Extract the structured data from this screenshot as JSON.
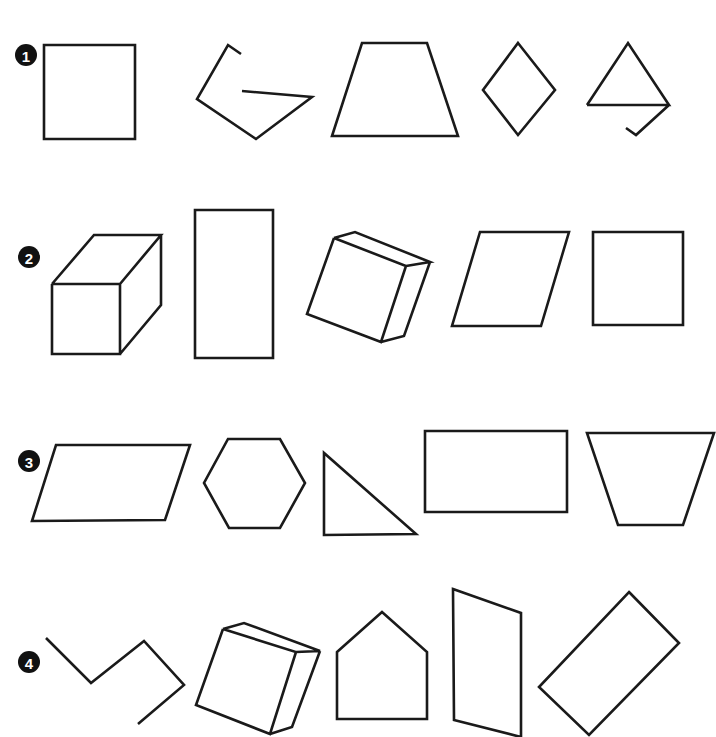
{
  "worksheet": {
    "title": "Shape recognition rows",
    "rows": [
      {
        "label": "1",
        "badge": {
          "cx": 26,
          "cy": 55
        },
        "shapes": [
          {
            "name": "square",
            "closed": true,
            "points": "44,45 135,45 135,139 44,139"
          },
          {
            "name": "open-pentagon-path",
            "closed": false,
            "points": "242,91 312,97 256,139 197,99 228,45 241,54"
          },
          {
            "name": "trapezoid",
            "closed": true,
            "points": "362,43 427,43 458,136 332,136"
          },
          {
            "name": "rhombus",
            "closed": true,
            "points": "518,43 555,90 518,135 483,90"
          },
          {
            "name": "triangle-with-tail",
            "closed": false,
            "points": "587,105 669,105 628,43 587,105 M669,105 636,135 626,128"
          }
        ]
      },
      {
        "label": "2",
        "badge": {
          "cx": 29,
          "cy": 257
        },
        "shapes": [
          {
            "name": "cube",
            "closed": false,
            "points": "52,284 120,284 120,354 52,354 52,284 M52,284 94,235 161,235 120,284 M161,235 161,305 120,354"
          },
          {
            "name": "tall-rectangle",
            "closed": true,
            "points": "195,210 273,210 273,358 195,358"
          },
          {
            "name": "tilted-box",
            "closed": false,
            "points": "334,238 307,314 381,342 406,266 334,238 M334,238 355,232 430,262 406,266 M430,262 404,336 381,342"
          },
          {
            "name": "parallelogram",
            "closed": true,
            "points": "480,232 569,232 541,326 452,326"
          },
          {
            "name": "square",
            "closed": true,
            "points": "593,232 683,232 683,325 593,325"
          }
        ]
      },
      {
        "label": "3",
        "badge": {
          "cx": 29,
          "cy": 461
        },
        "shapes": [
          {
            "name": "parallelogram",
            "closed": true,
            "points": "56,445 190,445 165,520 32,521"
          },
          {
            "name": "hexagon",
            "closed": true,
            "points": "228,439 280,439 305,483 280,528 229,528 204,483"
          },
          {
            "name": "right-triangle",
            "closed": true,
            "points": "324,453 324,535 416,534"
          },
          {
            "name": "rectangle",
            "closed": true,
            "points": "425,431 567,431 567,512 425,512"
          },
          {
            "name": "inverted-trapezoid",
            "closed": true,
            "points": "587,433 714,433 683,525 618,525"
          }
        ]
      },
      {
        "label": "4",
        "badge": {
          "cx": 29,
          "cy": 662
        },
        "shapes": [
          {
            "name": "open-zigzag-path",
            "closed": false,
            "points": "46,638 91,683 144,641 184,685 138,724"
          },
          {
            "name": "tilted-box",
            "closed": false,
            "points": "223,629 196,705 270,734 296,652 223,629 M223,629 244,623 320,651 296,652 M320,651 292,727 270,734"
          },
          {
            "name": "house-pentagon",
            "closed": true,
            "points": "337,652 382,612 427,652 427,719 337,719"
          },
          {
            "name": "tall-quadrilateral",
            "closed": true,
            "points": "453,589 521,613 521,737 454,720"
          },
          {
            "name": "tilted-rectangle",
            "closed": true,
            "points": "629,592 679,643 589,735 539,687"
          }
        ]
      }
    ]
  }
}
